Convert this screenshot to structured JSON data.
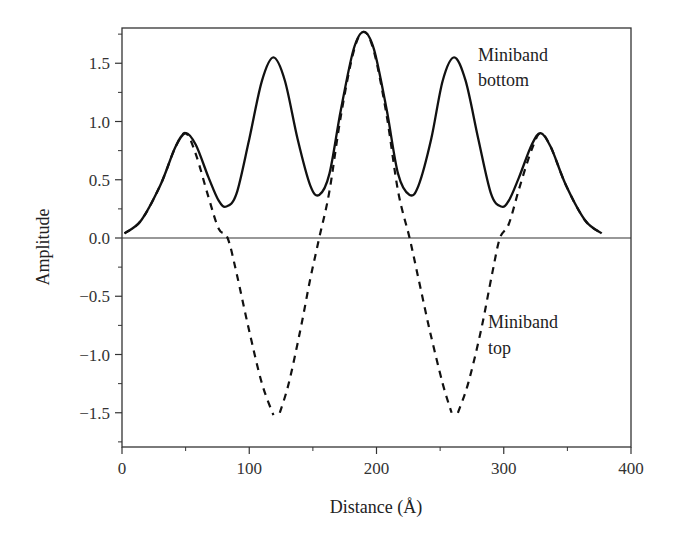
{
  "chart_data": {
    "type": "line",
    "title": "",
    "xlabel": "Distance (Å)",
    "ylabel": "Amplitude",
    "xlim": [
      0,
      400
    ],
    "ylim": [
      -1.8,
      1.8
    ],
    "x_ticks": [
      0,
      100,
      200,
      300,
      400
    ],
    "x_tick_labels": [
      "0",
      "100",
      "200",
      "300",
      "400"
    ],
    "x_minor_step": 50,
    "y_ticks": [
      -1.5,
      -1.0,
      -0.5,
      0.0,
      0.5,
      1.0,
      1.5
    ],
    "y_tick_labels": [
      "−1.5",
      "−1.0",
      "−0.5",
      "0.0",
      "0.5",
      "1.0",
      "1.5"
    ],
    "y_minor_step": 0.25,
    "grid": false,
    "zero_line": true,
    "legend": "none (inline annotations)",
    "annotations": [
      {
        "lines": [
          "Miniband",
          "bottom"
        ],
        "x": 267,
        "y": 1.45,
        "series": "Miniband bottom"
      },
      {
        "lines": [
          "Miniband",
          "top"
        ],
        "x": 288,
        "y": -0.75,
        "series": "Miniband top"
      }
    ],
    "series": [
      {
        "name": "Miniband bottom",
        "style": "solid",
        "points": [
          [
            2,
            0.04
          ],
          [
            15,
            0.15
          ],
          [
            30,
            0.45
          ],
          [
            42,
            0.78
          ],
          [
            50,
            0.9
          ],
          [
            58,
            0.8
          ],
          [
            68,
            0.52
          ],
          [
            76,
            0.32
          ],
          [
            82,
            0.27
          ],
          [
            90,
            0.38
          ],
          [
            100,
            0.85
          ],
          [
            110,
            1.35
          ],
          [
            119,
            1.55
          ],
          [
            128,
            1.35
          ],
          [
            138,
            0.85
          ],
          [
            148,
            0.45
          ],
          [
            155,
            0.37
          ],
          [
            163,
            0.55
          ],
          [
            172,
            1.1
          ],
          [
            182,
            1.62
          ],
          [
            190,
            1.77
          ],
          [
            198,
            1.62
          ],
          [
            208,
            1.1
          ],
          [
            217,
            0.55
          ],
          [
            226,
            0.37
          ],
          [
            233,
            0.45
          ],
          [
            243,
            0.85
          ],
          [
            252,
            1.35
          ],
          [
            261,
            1.55
          ],
          [
            270,
            1.35
          ],
          [
            280,
            0.85
          ],
          [
            290,
            0.38
          ],
          [
            298,
            0.27
          ],
          [
            304,
            0.32
          ],
          [
            312,
            0.52
          ],
          [
            322,
            0.8
          ],
          [
            329,
            0.9
          ],
          [
            337,
            0.78
          ],
          [
            349,
            0.45
          ],
          [
            364,
            0.15
          ],
          [
            377,
            0.04
          ]
        ]
      },
      {
        "name": "Miniband top",
        "style": "dashed",
        "segments": [
          [
            [
              2,
              0.04
            ],
            [
              15,
              0.15
            ],
            [
              30,
              0.45
            ],
            [
              42,
              0.78
            ],
            [
              50,
              0.9
            ],
            [
              58,
              0.72
            ],
            [
              68,
              0.35
            ],
            [
              76,
              0.08
            ],
            [
              83,
              0.0
            ],
            [
              90,
              -0.3
            ],
            [
              100,
              -0.8
            ],
            [
              110,
              -1.25
            ],
            [
              119,
              -1.52
            ]
          ],
          [
            [
              124,
              -1.5
            ],
            [
              131,
              -1.25
            ],
            [
              140,
              -0.8
            ],
            [
              148,
              -0.35
            ],
            [
              155,
              0.0
            ],
            [
              163,
              0.4
            ],
            [
              172,
              1.05
            ],
            [
              182,
              1.6
            ],
            [
              190,
              1.77
            ],
            [
              198,
              1.6
            ],
            [
              208,
              1.05
            ],
            [
              217,
              0.4
            ],
            [
              226,
              0.0
            ],
            [
              233,
              -0.35
            ],
            [
              242,
              -0.8
            ],
            [
              252,
              -1.25
            ],
            [
              259,
              -1.5
            ]
          ],
          [
            [
              264,
              -1.5
            ],
            [
              272,
              -1.25
            ],
            [
              282,
              -0.8
            ],
            [
              291,
              -0.3
            ],
            [
              297,
              0.0
            ],
            [
              304,
              0.12
            ],
            [
              312,
              0.42
            ],
            [
              322,
              0.76
            ],
            [
              329,
              0.9
            ],
            [
              337,
              0.78
            ],
            [
              349,
              0.45
            ],
            [
              364,
              0.15
            ],
            [
              377,
              0.04
            ]
          ]
        ]
      }
    ]
  },
  "labels": {
    "xlabel": "Distance (Å)",
    "ylabel": "Amplitude",
    "annotation_bottom_1": "Miniband",
    "annotation_bottom_2": "bottom",
    "annotation_top_1": "Miniband",
    "annotation_top_2": "top"
  }
}
